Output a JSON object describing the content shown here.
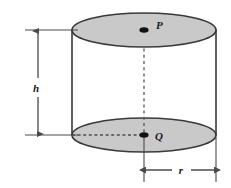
{
  "figure": {
    "shape": "cylinder",
    "colors": {
      "face_fill": "#c9c9c9",
      "outline": "#3a3a3a",
      "dimension_line": "#4a4a4a",
      "dashed_line": "#555555",
      "label_text": "#1a1a1a",
      "background": "#ffffff"
    },
    "geometry": {
      "left_edge_x": 70,
      "right_edge_x": 215,
      "center_x": 144,
      "top_face_center_y": 30,
      "bottom_face_center_y": 135,
      "ellipse_rx": 72,
      "ellipse_ry": 17
    },
    "points": [
      {
        "name": "P",
        "label": "P",
        "role": "center-of-top-face",
        "x": 144,
        "y": 30
      },
      {
        "name": "Q",
        "label": "Q",
        "role": "center-of-bottom-face",
        "x": 144,
        "y": 135
      }
    ],
    "dimensions": [
      {
        "name": "height",
        "label": "h",
        "orientation": "vertical",
        "from_y": 30,
        "to_y": 135,
        "axis_x": 38,
        "label_x": 36,
        "label_y": 88,
        "arrowheads": "both"
      },
      {
        "name": "radius",
        "label": "r",
        "orientation": "horizontal",
        "from_x": 144,
        "to_x": 215,
        "axis_y": 170,
        "label_x": 182,
        "label_y": 168,
        "arrowheads": "both"
      }
    ],
    "guide_lines": [
      {
        "name": "axis-p-to-q",
        "style": "dashed",
        "from": "P",
        "to": "Q"
      },
      {
        "name": "radius-in-bottom-face",
        "style": "dashed",
        "from": "bottom-face-left-edge",
        "to": "Q"
      }
    ]
  }
}
